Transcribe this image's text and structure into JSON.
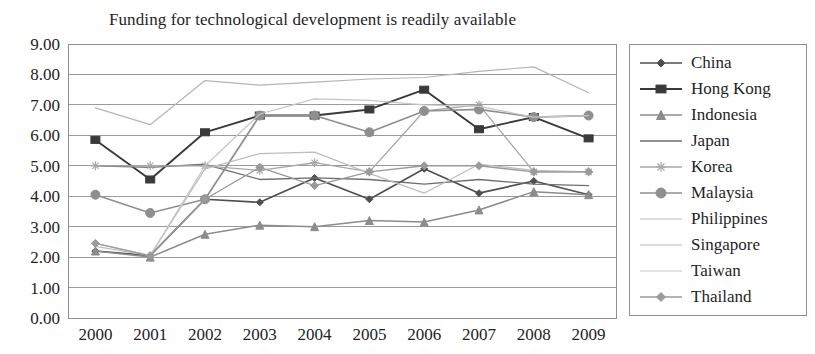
{
  "chart_data": {
    "type": "line",
    "title": "Funding for technological development is readily available",
    "xlabel": "",
    "ylabel": "",
    "x": [
      "2000",
      "2001",
      "2002",
      "2003",
      "2004",
      "2005",
      "2006",
      "2007",
      "2008",
      "2009"
    ],
    "categories": [
      "2000",
      "2001",
      "2002",
      "2003",
      "2004",
      "2005",
      "2006",
      "2007",
      "2008",
      "2009"
    ],
    "ylim": [
      0,
      9
    ],
    "ytick_step": 1,
    "ytick_labels": [
      "0.00",
      "1.00",
      "2.00",
      "3.00",
      "4.00",
      "5.00",
      "6.00",
      "7.00",
      "8.00",
      "9.00"
    ],
    "grid": "horizontal",
    "legend_position": "right",
    "series": [
      {
        "name": "China",
        "color": "#4f4f4f",
        "marker": "diamond",
        "marker_size": 7,
        "line_width": 1.7,
        "values": [
          2.2,
          2.05,
          3.9,
          3.8,
          4.6,
          3.9,
          4.9,
          4.1,
          4.5,
          4.05
        ]
      },
      {
        "name": "Hong Kong",
        "color": "#3a3a3a",
        "marker": "square",
        "marker_size": 9,
        "line_width": 1.9,
        "values": [
          5.85,
          4.55,
          6.1,
          6.65,
          6.65,
          6.85,
          7.5,
          6.2,
          6.6,
          5.9
        ]
      },
      {
        "name": "Indonesia",
        "color": "#8c8c8c",
        "marker": "triangle",
        "marker_size": 8,
        "line_width": 1.5,
        "values": [
          2.2,
          2.0,
          2.75,
          3.05,
          3.0,
          3.2,
          3.15,
          3.55,
          4.15,
          4.05
        ]
      },
      {
        "name": "Japan",
        "color": "#6e6e6e",
        "marker": "none",
        "marker_size": 0,
        "line_width": 1.3,
        "values": [
          5.0,
          4.95,
          5.05,
          4.55,
          4.6,
          4.55,
          4.4,
          4.55,
          4.4,
          4.35
        ]
      },
      {
        "name": "Korea",
        "color": "#a8a8a8",
        "marker": "asterisk",
        "marker_size": 9,
        "line_width": 1.3,
        "values": [
          5.0,
          5.0,
          5.0,
          4.85,
          5.1,
          4.8,
          6.8,
          7.0,
          4.8,
          4.8
        ]
      },
      {
        "name": "Malaysia",
        "color": "#8f8f8f",
        "marker": "circle",
        "marker_size": 9,
        "line_width": 1.7,
        "values": [
          4.05,
          3.45,
          3.9,
          6.65,
          6.65,
          6.1,
          6.8,
          6.85,
          6.6,
          6.65
        ]
      },
      {
        "name": "Philippines",
        "color": "#bdbdbd",
        "marker": "none",
        "marker_size": 0,
        "line_width": 1.2,
        "values": [
          2.35,
          2.05,
          4.9,
          5.4,
          5.45,
          4.75,
          4.1,
          5.05,
          4.85,
          4.8
        ]
      },
      {
        "name": "Singapore",
        "color": "#b5b5b5",
        "marker": "none",
        "marker_size": 0,
        "line_width": 1.2,
        "values": [
          6.9,
          6.35,
          7.8,
          7.65,
          7.75,
          7.85,
          7.9,
          8.1,
          8.25,
          7.4
        ]
      },
      {
        "name": "Taiwan",
        "color": "#c6c6c6",
        "marker": "none",
        "marker_size": 0,
        "line_width": 1.2,
        "values": [
          2.45,
          2.05,
          5.0,
          6.7,
          7.2,
          7.15,
          7.0,
          6.95,
          6.6,
          6.65
        ]
      },
      {
        "name": "Thailand",
        "color": "#9a9a9a",
        "marker": "diamond",
        "marker_size": 8,
        "line_width": 1.4,
        "values": [
          2.45,
          2.05,
          3.9,
          4.95,
          4.35,
          4.8,
          5.0,
          5.0,
          4.8,
          4.8
        ]
      }
    ]
  },
  "legend": {
    "items": [
      {
        "label": "China"
      },
      {
        "label": "Hong Kong"
      },
      {
        "label": "Indonesia"
      },
      {
        "label": "Japan"
      },
      {
        "label": "Korea"
      },
      {
        "label": "Malaysia"
      },
      {
        "label": "Philippines"
      },
      {
        "label": "Singapore"
      },
      {
        "label": "Taiwan"
      },
      {
        "label": "Thailand"
      }
    ]
  },
  "plot_geometry": {
    "left": 68,
    "right": 616,
    "top": 44,
    "bottom": 318
  }
}
